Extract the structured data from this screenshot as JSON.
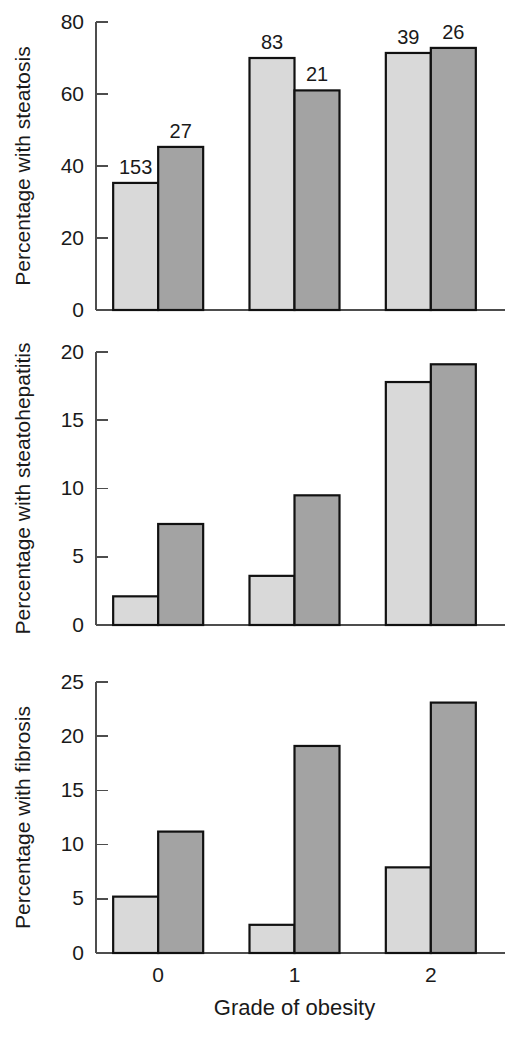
{
  "figure": {
    "background_color": "#ffffff",
    "axis_color": "#4d4d4d",
    "bar_outline_color": "#111111",
    "series_colors": [
      "#d9d9d9",
      "#a3a3a3"
    ],
    "xlabel": "Grade of obesity",
    "categories": [
      "0",
      "1",
      "2"
    ]
  },
  "chart_data": [
    {
      "type": "bar",
      "title": "",
      "ylabel": "Percentage with steatosis",
      "xlabel": "",
      "categories": [
        "0",
        "1",
        "2"
      ],
      "ylim": [
        0,
        80
      ],
      "yticks": [
        0,
        20,
        40,
        60,
        80
      ],
      "ytick_labels": [
        "0",
        "20",
        "40",
        "60",
        "80"
      ],
      "grid": false,
      "legend": "none",
      "series": [
        {
          "name": "series-1-light",
          "color": "#d9d9d9",
          "values": [
            35.3,
            70.0,
            71.4
          ],
          "point_labels": [
            "153",
            "83",
            "39"
          ]
        },
        {
          "name": "series-2-dark",
          "color": "#a3a3a3",
          "values": [
            45.3,
            61.0,
            72.8
          ],
          "point_labels": [
            "27",
            "21",
            "26"
          ]
        }
      ]
    },
    {
      "type": "bar",
      "title": "",
      "ylabel": "Percentage with steatohepatitis",
      "xlabel": "",
      "categories": [
        "0",
        "1",
        "2"
      ],
      "ylim": [
        0,
        20
      ],
      "yticks": [
        0,
        5,
        10,
        15,
        20
      ],
      "ytick_labels": [
        "0",
        "5",
        "10",
        "15",
        "20"
      ],
      "grid": false,
      "legend": "none",
      "series": [
        {
          "name": "series-1-light",
          "color": "#d9d9d9",
          "values": [
            2.1,
            3.6,
            17.8
          ],
          "point_labels": [
            "",
            "",
            ""
          ]
        },
        {
          "name": "series-2-dark",
          "color": "#a3a3a3",
          "values": [
            7.4,
            9.5,
            19.1
          ],
          "point_labels": [
            "",
            "",
            ""
          ]
        }
      ]
    },
    {
      "type": "bar",
      "title": "",
      "ylabel": "Percentage with fibrosis",
      "xlabel": "Grade of obesity",
      "categories": [
        "0",
        "1",
        "2"
      ],
      "ylim": [
        0,
        25
      ],
      "yticks": [
        0,
        5,
        10,
        15,
        20,
        25
      ],
      "ytick_labels": [
        "0",
        "5",
        "10",
        "15",
        "20",
        "25"
      ],
      "grid": false,
      "legend": "none",
      "series": [
        {
          "name": "series-1-light",
          "color": "#d9d9d9",
          "values": [
            5.2,
            2.6,
            7.9
          ],
          "point_labels": [
            "",
            "",
            ""
          ]
        },
        {
          "name": "series-2-dark",
          "color": "#a3a3a3",
          "values": [
            11.2,
            19.1,
            23.1
          ],
          "point_labels": [
            "",
            "",
            ""
          ]
        }
      ]
    }
  ]
}
